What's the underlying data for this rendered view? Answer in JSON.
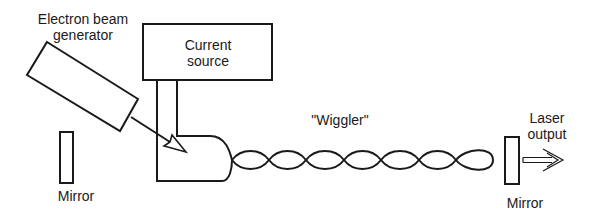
{
  "diagram": {
    "labels": {
      "electron_beam_generator": [
        "Electron beam",
        "generator"
      ],
      "current_source": [
        "Current",
        "source"
      ],
      "wiggler": "\"Wiggler\"",
      "laser_output": [
        "Laser",
        "output"
      ],
      "mirror_left": "Mirror",
      "mirror_right": "Mirror"
    },
    "colors": {
      "line": "#1a1a1a",
      "background": "#ffffff"
    },
    "components": [
      {
        "id": "electron-beam-generator",
        "shape": "rotated-rectangle",
        "corners": [
          [
            47,
            42
          ],
          [
            138,
            99
          ],
          [
            120,
            131
          ],
          [
            27,
            75
          ]
        ]
      },
      {
        "id": "current-source",
        "shape": "rectangle",
        "x": 143,
        "y": 24,
        "w": 129,
        "h": 56
      },
      {
        "id": "mirror-left",
        "shape": "rectangle",
        "x": 60,
        "y": 132,
        "w": 13,
        "h": 51
      },
      {
        "id": "mirror-right",
        "shape": "rectangle",
        "x": 505,
        "y": 137,
        "w": 14,
        "h": 47
      },
      {
        "id": "wiggler",
        "shape": "sinusoidal-helix",
        "crossings_x": [
          232,
          269,
          306,
          344,
          381,
          419,
          456
        ],
        "end_x": 493,
        "center_y": 160,
        "amplitude": 10
      },
      {
        "id": "laser-output-arrow",
        "shape": "hollow-arrow",
        "from": [
          523,
          160
        ],
        "to": [
          563,
          160
        ]
      },
      {
        "id": "electron-beam-arrow",
        "shape": "hollow-arrow",
        "from": [
          131,
          117
        ],
        "to": [
          186,
          152
        ]
      }
    ]
  }
}
